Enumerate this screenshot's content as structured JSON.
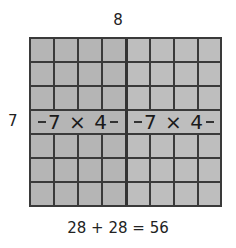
{
  "diagram": {
    "columns_label": "8",
    "rows_label": "7",
    "rows": 7,
    "columns": 8,
    "split_after_column": 4,
    "left_part": {
      "label": "7 × 4",
      "fill": "#b5b5b5"
    },
    "right_part": {
      "label": "7 × 4",
      "fill": "#bebebe"
    },
    "equation": "28 + 28 = 56",
    "line_color": "#3a3a3a"
  }
}
